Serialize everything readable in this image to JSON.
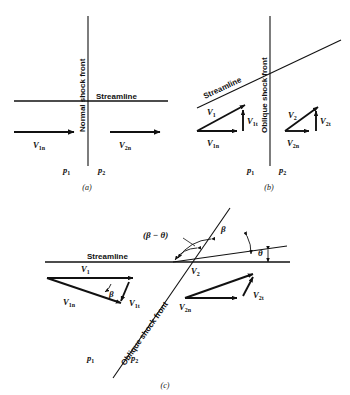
{
  "figure": {
    "panels": [
      {
        "id": "a",
        "caption": "(a)",
        "shock_label": "Normal shock front",
        "streamline_label": "Streamline",
        "vectors": [
          {
            "name": "V1n",
            "base": "V",
            "sub": "1n"
          },
          {
            "name": "V2n",
            "base": "V",
            "sub": "2n"
          }
        ],
        "pressures": [
          {
            "name": "p1",
            "base": "p",
            "sub": "1"
          },
          {
            "name": "p2",
            "base": "p",
            "sub": "2"
          }
        ]
      },
      {
        "id": "b",
        "caption": "(b)",
        "shock_label": "Oblique shock front",
        "streamline_label": "Streamline",
        "vectors": [
          {
            "name": "V1",
            "base": "V",
            "sub": "1"
          },
          {
            "name": "V1t",
            "base": "V",
            "sub": "1t"
          },
          {
            "name": "V1n",
            "base": "V",
            "sub": "1n"
          },
          {
            "name": "V2",
            "base": "V",
            "sub": "2"
          },
          {
            "name": "V2t",
            "base": "V",
            "sub": "2t"
          },
          {
            "name": "V2n",
            "base": "V",
            "sub": "2n"
          }
        ],
        "pressures": [
          {
            "name": "p1",
            "base": "p",
            "sub": "1"
          },
          {
            "name": "p2",
            "base": "p",
            "sub": "2"
          }
        ]
      },
      {
        "id": "c",
        "caption": "(c)",
        "shock_label": "Oblique shock front",
        "streamline_label": "Streamline",
        "angles": [
          {
            "name": "beta-minus-theta",
            "text": "(β − θ)"
          },
          {
            "name": "beta",
            "text": "β"
          },
          {
            "name": "theta",
            "text": "θ"
          },
          {
            "name": "beta-inner",
            "text": "β"
          }
        ],
        "vectors": [
          {
            "name": "V1",
            "base": "V",
            "sub": "1"
          },
          {
            "name": "V1n",
            "base": "V",
            "sub": "1n"
          },
          {
            "name": "V1t",
            "base": "V",
            "sub": "1t"
          },
          {
            "name": "V2",
            "base": "V",
            "sub": "2"
          },
          {
            "name": "V2n",
            "base": "V",
            "sub": "2n"
          },
          {
            "name": "V2t",
            "base": "V",
            "sub": "2t"
          }
        ],
        "pressures": [
          {
            "name": "p1",
            "base": "p",
            "sub": "1"
          },
          {
            "name": "p2",
            "base": "p",
            "sub": "2"
          }
        ]
      }
    ]
  },
  "colors": {
    "ink": "#111111",
    "paper": "#ffffff"
  }
}
